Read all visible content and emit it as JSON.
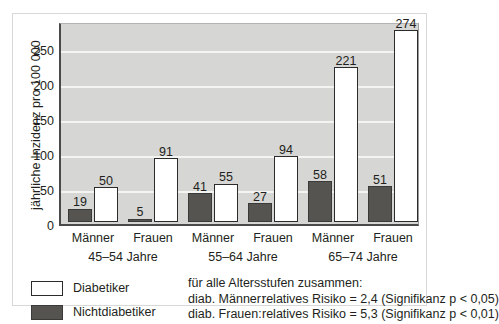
{
  "chart_data": {
    "type": "bar",
    "title": "",
    "xlabel": "",
    "ylabel": "jährliche Inzidenz pro 100 000",
    "ylim": [
      0,
      290
    ],
    "yticks": [
      0,
      50,
      100,
      150,
      200,
      250
    ],
    "grid": true,
    "legend_position": "bottom-left",
    "categories": [
      "45-54 Jahre / Männer",
      "45-54 Jahre / Frauen",
      "55-64 Jahre / Männer",
      "55-64 Jahre / Frauen",
      "65-74 Jahre / Männer",
      "65-74 Jahre / Frauen"
    ],
    "series": [
      {
        "name": "Nichtdiabetiker",
        "color": "#555451",
        "values": [
          19,
          5,
          41,
          27,
          58,
          51
        ]
      },
      {
        "name": "Diabetiker",
        "color": "#ffffff",
        "values": [
          50,
          91,
          55,
          94,
          221,
          274
        ]
      }
    ],
    "groups": [
      {
        "label": "45–54 Jahre",
        "sexes": [
          "Männer",
          "Frauen"
        ]
      },
      {
        "label": "55–64 Jahre",
        "sexes": [
          "Männer",
          "Frauen"
        ]
      },
      {
        "label": "65–74 Jahre",
        "sexes": [
          "Männer",
          "Frauen"
        ]
      }
    ],
    "annotations": [
      "für alle Altersstufen zusammen:",
      "diab. Männer:  relatives Risiko = 2,4 (Signifikanz p < 0,05)",
      "diab. Frauen:  relatives Risiko = 5,3 (Signifikanz p < 0,01)"
    ]
  },
  "axis": {
    "y_title": "jährliche Inzidenz pro 100 000",
    "ticks": [
      "0",
      "50",
      "100",
      "150",
      "200",
      "250"
    ]
  },
  "sub_labels": [
    "Männer",
    "Frauen",
    "Männer",
    "Frauen",
    "Männer",
    "Frauen"
  ],
  "group_labels": [
    "45–54 Jahre",
    "55–64 Jahre",
    "65–74 Jahre"
  ],
  "bar_values": [
    "19",
    "50",
    "5",
    "91",
    "41",
    "55",
    "27",
    "94",
    "58",
    "221",
    "51",
    "274"
  ],
  "legend": {
    "items": [
      {
        "label": "Diabetiker",
        "style": "light"
      },
      {
        "label": "Nichtdiabetiker",
        "style": "dark"
      }
    ]
  },
  "footnote": {
    "heading": "für alle Altersstufen zusammen:",
    "rows": [
      {
        "key": "diab. Männer:",
        "text": "relatives Risiko = 2,4 (Signifikanz p < 0,05)"
      },
      {
        "key": "diab. Frauen:",
        "text": "relatives Risiko = 5,3 (Signifikanz p < 0,01)"
      }
    ]
  },
  "colors": {
    "plot_background": "#d6d6d4",
    "gridline": "#f4f4f2",
    "nondiabetic_bar": "#555451",
    "diabetic_bar": "#ffffff",
    "axis": "#4a4a4a",
    "frame": "#d8d8d8",
    "text": "#231f20"
  }
}
